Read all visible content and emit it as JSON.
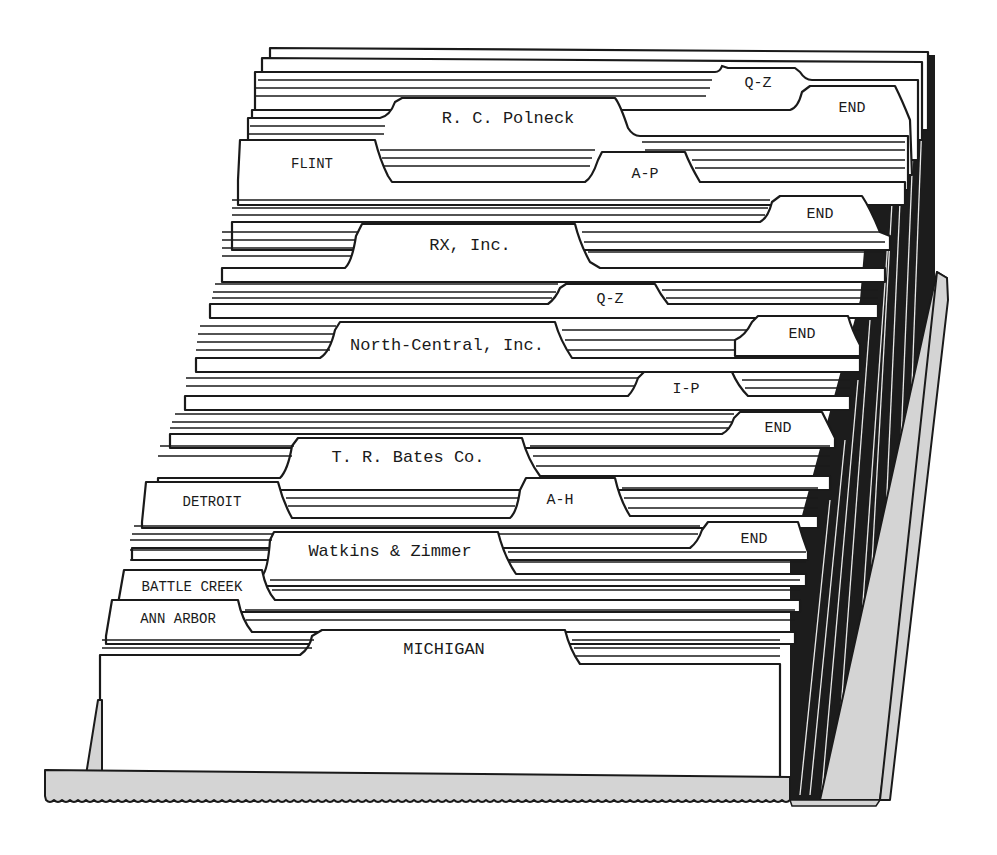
{
  "figure": {
    "tabs": [
      {
        "id": "t1",
        "label": "Q-Z",
        "tier": "top"
      },
      {
        "id": "t2",
        "label": "END",
        "tier": "top"
      },
      {
        "id": "t3",
        "label": "R. C. Polneck",
        "tier": "name"
      },
      {
        "id": "t4",
        "label": "FLINT",
        "tier": "city"
      },
      {
        "id": "t5",
        "label": "A-P",
        "tier": "alpha"
      },
      {
        "id": "t6",
        "label": "END",
        "tier": "end"
      },
      {
        "id": "t7",
        "label": "RX, Inc.",
        "tier": "name"
      },
      {
        "id": "t8",
        "label": "Q-Z",
        "tier": "alpha"
      },
      {
        "id": "t9",
        "label": "North-Central, Inc.",
        "tier": "name"
      },
      {
        "id": "t10",
        "label": "END",
        "tier": "end"
      },
      {
        "id": "t11",
        "label": "I-P",
        "tier": "alpha"
      },
      {
        "id": "t12",
        "label": "END",
        "tier": "end"
      },
      {
        "id": "t13",
        "label": "T. R. Bates Co.",
        "tier": "name"
      },
      {
        "id": "t14",
        "label": "DETROIT",
        "tier": "city"
      },
      {
        "id": "t15",
        "label": "A-H",
        "tier": "alpha"
      },
      {
        "id": "t16",
        "label": "END",
        "tier": "end"
      },
      {
        "id": "t17",
        "label": "Watkins & Zimmer",
        "tier": "name"
      },
      {
        "id": "t18",
        "label": "BATTLE CREEK",
        "tier": "city"
      },
      {
        "id": "t19",
        "label": "ANN ARBOR",
        "tier": "city"
      },
      {
        "id": "t20",
        "label": "MICHIGAN",
        "tier": "state"
      }
    ]
  }
}
